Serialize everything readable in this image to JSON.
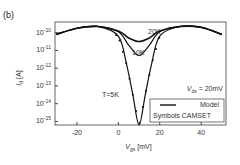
{
  "panel_label": "(b)",
  "chart_data": {
    "type": "line",
    "title": "",
    "xlabel": "V_gs [mV]",
    "ylabel": "I_d [A]",
    "xlim": [
      -30.6,
      52
    ],
    "ylim_log10": [
      -15.2,
      -9.4
    ],
    "x_ticks": [
      -20,
      0,
      20,
      40
    ],
    "x_tick_labels": [
      "-20",
      "0",
      "20",
      "40"
    ],
    "y_ticks_log10": [
      -10,
      -11,
      -12,
      -13,
      -14,
      -15
    ],
    "y_tick_labels": [
      "10^-10",
      "10^-11",
      "10^-12",
      "10^-13",
      "10^-14",
      "10^-15"
    ],
    "y_scale": "log",
    "grid": false,
    "annotations": [
      "20K",
      "10K",
      "T=5K",
      "V_ds = 20mV"
    ],
    "legend": {
      "position": "lower right",
      "entries": [
        {
          "style": "line",
          "label": "Model"
        },
        {
          "style": "symbols",
          "label": "Symbols  CAMSET"
        }
      ]
    },
    "series": [
      {
        "name": "T=20K",
        "x": [
          -30,
          -20,
          -10,
          0,
          5,
          10,
          15,
          20,
          30,
          40,
          50
        ],
        "log10_y": [
          -10.1,
          -9.75,
          -9.65,
          -9.9,
          -10.3,
          -10.5,
          -10.3,
          -9.9,
          -9.65,
          -9.7,
          -10.1
        ]
      },
      {
        "name": "T=10K",
        "x": [
          -30,
          -20,
          -10,
          0,
          5,
          10,
          15,
          20,
          30,
          40,
          50
        ],
        "log10_y": [
          -10.1,
          -9.75,
          -9.65,
          -9.95,
          -10.7,
          -11.3,
          -10.7,
          -9.95,
          -9.65,
          -9.7,
          -10.1
        ]
      },
      {
        "name": "T=5K",
        "x": [
          -30,
          -20,
          -10,
          0,
          4,
          7,
          10,
          13,
          16,
          20,
          30,
          40,
          50
        ],
        "log10_y": [
          -10.1,
          -9.75,
          -9.65,
          -10.2,
          -11.8,
          -13.5,
          -15.2,
          -13.5,
          -11.8,
          -10.2,
          -9.65,
          -9.7,
          -10.1
        ]
      }
    ]
  }
}
